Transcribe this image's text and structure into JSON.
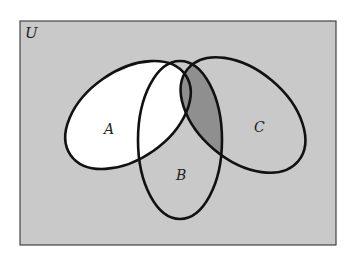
{
  "diagram": {
    "type": "venn",
    "universe_label": "U",
    "sets": [
      {
        "name": "A",
        "label": "A"
      },
      {
        "name": "B",
        "label": "B"
      },
      {
        "name": "C",
        "label": "C"
      }
    ],
    "shading": {
      "background": "light-gray",
      "white_region": "A minus (B ∩ C)",
      "dark_region": "B ∩ C"
    },
    "colors": {
      "background": "#c9c9c9",
      "white": "#ffffff",
      "dark": "#8f8f8f",
      "stroke": "#111111",
      "frame": "#444444"
    }
  }
}
